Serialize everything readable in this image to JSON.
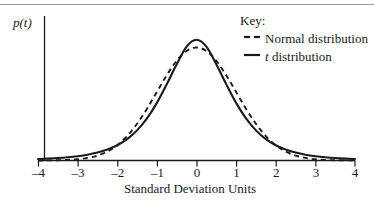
{
  "chart_data": {
    "type": "line",
    "title": "",
    "xlabel": "Standard Deviation Units",
    "ylabel": "p(t)",
    "xlim": [
      -4,
      4
    ],
    "ylim": [
      0,
      0.45
    ],
    "xticks": [
      "-4",
      "-3",
      "-2",
      "-1",
      "0",
      "1",
      "2",
      "3",
      "4"
    ],
    "xtick_values": [
      -4,
      -3,
      -2,
      -1,
      0,
      1,
      2,
      3,
      4
    ],
    "yticks": [],
    "grid": false,
    "legend_position": "top-right",
    "legend_title": "Key:",
    "series": [
      {
        "name": "Normal distribution",
        "style": "dashed",
        "color": "#1a1a1a",
        "x": [
          -4,
          -3.75,
          -3.5,
          -3.25,
          -3,
          -2.75,
          -2.5,
          -2.25,
          -2,
          -1.75,
          -1.5,
          -1.25,
          -1,
          -0.75,
          -0.5,
          -0.25,
          0,
          0.25,
          0.5,
          0.75,
          1,
          1.25,
          1.5,
          1.75,
          2,
          2.25,
          2.5,
          2.75,
          3,
          3.25,
          3.5,
          3.75,
          4
        ],
        "y": [
          0.0001,
          0.0004,
          0.0009,
          0.002,
          0.0044,
          0.0091,
          0.0175,
          0.0317,
          0.054,
          0.0863,
          0.1295,
          0.1826,
          0.242,
          0.3011,
          0.3521,
          0.3867,
          0.3989,
          0.3867,
          0.3521,
          0.3011,
          0.242,
          0.1826,
          0.1295,
          0.0863,
          0.054,
          0.0317,
          0.0175,
          0.0091,
          0.0044,
          0.002,
          0.0009,
          0.0004,
          0.0001
        ]
      },
      {
        "name": "t distribution",
        "style": "solid",
        "color": "#1a1a1a",
        "x": [
          -4,
          -3.75,
          -3.5,
          -3.25,
          -3,
          -2.75,
          -2.5,
          -2.25,
          -2,
          -1.75,
          -1.5,
          -1.25,
          -1,
          -0.75,
          -0.5,
          -0.25,
          0,
          0.25,
          0.5,
          0.75,
          1,
          1.25,
          1.5,
          1.75,
          2,
          2.25,
          2.5,
          2.75,
          3,
          3.25,
          3.5,
          3.75,
          4
        ],
        "y": [
          0.0051,
          0.0066,
          0.0086,
          0.0114,
          0.0152,
          0.0205,
          0.028,
          0.0386,
          0.0538,
          0.0755,
          0.1063,
          0.1483,
          0.2034,
          0.2696,
          0.3397,
          0.4021,
          0.4261,
          0.4021,
          0.3397,
          0.2696,
          0.2034,
          0.1483,
          0.1063,
          0.0755,
          0.0538,
          0.0386,
          0.028,
          0.0205,
          0.0152,
          0.0114,
          0.0086,
          0.0066,
          0.0051
        ]
      }
    ],
    "annotations": [
      "Normal distribution has a higher peak at 0",
      "t distribution has heavier tails beyond about +/- 2.2"
    ]
  },
  "axes": {
    "y_label": "p(t)",
    "x_title": "Standard Deviation Units",
    "tick_labels": [
      "–4",
      "–3",
      "–2",
      "–1",
      "0",
      "1",
      "2",
      "3",
      "4"
    ]
  },
  "legend": {
    "title": "Key:",
    "entries": [
      {
        "label": "Normal distribution",
        "marker": "dashed-line"
      },
      {
        "label_italic": "t",
        "label_rest": " distribution",
        "marker": "solid-line"
      }
    ]
  }
}
